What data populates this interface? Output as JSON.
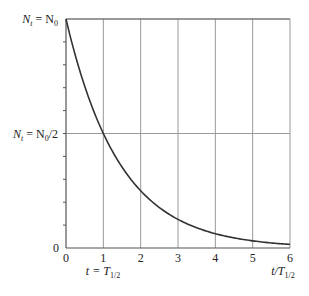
{
  "chart_data": {
    "type": "line",
    "title": "",
    "xlabel": "t/T1/2",
    "ylabel": "",
    "xlim": [
      0,
      6
    ],
    "ylim": [
      0,
      1
    ],
    "grid": {
      "vertical": true,
      "horizontal_half_line": true
    },
    "x_ticks": [
      "0",
      "1",
      "2",
      "3",
      "4",
      "5",
      "6"
    ],
    "y_tick_labels": [
      {
        "value": 1.0,
        "label": "N_t = N_0"
      },
      {
        "value": 0.5,
        "label": "N_t = N_0/2"
      },
      {
        "value": 0.0,
        "label": "0"
      }
    ],
    "y_minor_ticks": [
      0.1,
      0.2,
      0.3,
      0.4,
      0.5,
      0.6,
      0.7,
      0.8,
      0.9
    ],
    "annotations": [
      {
        "x": 1,
        "text": "t = T1/2",
        "position": "below x-axis"
      }
    ],
    "series": [
      {
        "name": "N_t / N_0 = 2^(-t/T1/2)",
        "x": [
          0,
          0.5,
          1,
          1.5,
          2,
          2.5,
          3,
          3.5,
          4,
          4.5,
          5,
          5.5,
          6
        ],
        "values": [
          1.0,
          0.707,
          0.5,
          0.354,
          0.25,
          0.177,
          0.125,
          0.088,
          0.0625,
          0.044,
          0.031,
          0.022,
          0.0156
        ]
      }
    ]
  },
  "labels": {
    "y_top_main": "N",
    "y_top_sub": "t",
    "y_top_eq": " = N",
    "y_top_sub2": "0",
    "y_half_main": "N",
    "y_half_sub": "t",
    "y_half_eq": " = N",
    "y_half_sub2": "0",
    "y_half_tail": "/2",
    "y_zero": "0",
    "x_ticks": [
      "0",
      "1",
      "2",
      "3",
      "4",
      "5",
      "6"
    ],
    "t_eq_label_main": "t = T",
    "t_eq_label_sub": "1/2",
    "x_axis_label_main": "t/T",
    "x_axis_label_sub": "1/2"
  },
  "colors": {
    "curve": "#333333",
    "grid": "#999999",
    "axis": "#555555"
  }
}
